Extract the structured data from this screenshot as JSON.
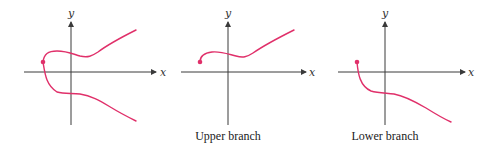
{
  "colors": {
    "curve": "#e0306a",
    "axis": "#3a3a3a"
  },
  "panels": [
    {
      "id": "full",
      "caption": "",
      "x_label": "x",
      "y_label": "y"
    },
    {
      "id": "upper",
      "caption": "Upper branch",
      "x_label": "x",
      "y_label": "y"
    },
    {
      "id": "lower",
      "caption": "Lower branch",
      "x_label": "x",
      "y_label": "y"
    }
  ]
}
